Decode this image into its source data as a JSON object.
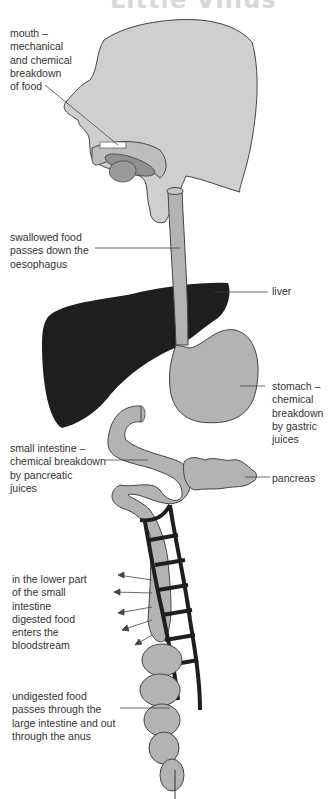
{
  "title": "Little Villus",
  "colors": {
    "organ_fill": "#b3b3b3",
    "head_fill": "#cfcfcf",
    "liver_fill": "#1e1e1e",
    "outline": "#333333",
    "text": "#333333"
  },
  "labels": {
    "mouth": "mouth –\nmechanical\nand chemical\nbreakdown\nof food",
    "oesophagus": "swallowed food\npasses down the\noesophagus",
    "liver": "liver",
    "stomach": "stomach –\nchemical\nbreakdown\nby gastric\njuices",
    "small_intestine": "small intestine –\nchemical breakdown\nby pancreatic\njuices",
    "pancreas": "pancreas",
    "absorption": "in the lower part\nof the small\nintestine\ndigested food\nenters the\nbloodstream",
    "large_intestine": "undigested food\npasses through the\nlarge intestine and out\nthrough the anus"
  }
}
